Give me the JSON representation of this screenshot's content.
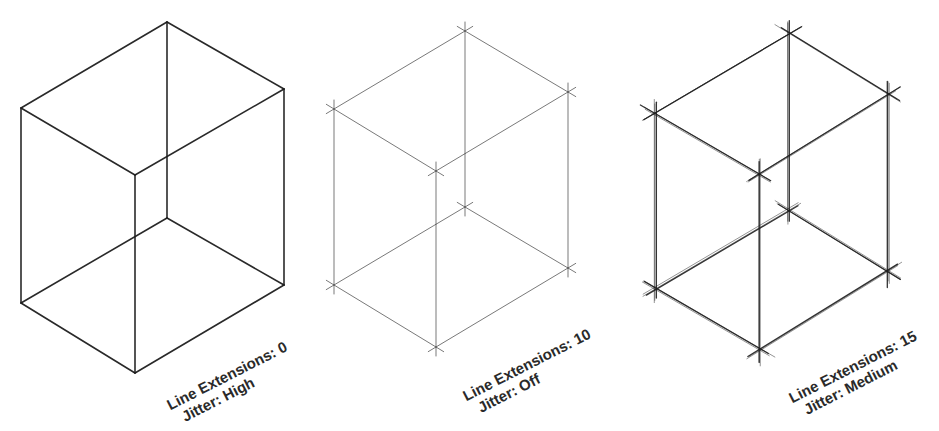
{
  "figure": {
    "background": "#ffffff",
    "line_color": "#1e1e1e",
    "panels": [
      {
        "id": "cube-1",
        "line_extensions_label": "Line Extensions: 0",
        "jitter_label": "Jitter: High",
        "line_extensions": 0,
        "jitter": "High",
        "vertices": {
          "top": [
            167,
            22
          ],
          "upper_left": [
            21,
            108
          ],
          "upper_right": [
            284,
            89
          ],
          "front_top": [
            135,
            175
          ],
          "back_bottom": [
            167,
            218
          ],
          "lower_left": [
            21,
            303
          ],
          "lower_right": [
            284,
            285
          ],
          "front_bottom": [
            135,
            373
          ]
        }
      },
      {
        "id": "cube-2",
        "line_extensions_label": "Line Extensions: 10",
        "jitter_label": "Jitter: Off",
        "line_extensions": 10,
        "jitter": "Off",
        "vertices": {
          "top": [
            465,
            31
          ],
          "upper_left": [
            334,
            109
          ],
          "upper_right": [
            568,
            92
          ],
          "front_top": [
            436,
            171
          ],
          "back_bottom": [
            465,
            207
          ],
          "lower_left": [
            334,
            285
          ],
          "lower_right": [
            568,
            268
          ],
          "front_bottom": [
            436,
            347
          ]
        }
      },
      {
        "id": "cube-3",
        "line_extensions_label": "Line Extensions: 15",
        "jitter_label": "Jitter: Medium",
        "line_extensions": 15,
        "jitter": "Medium",
        "vertices": {
          "top": [
            789,
            34
          ],
          "upper_left": [
            655,
            113
          ],
          "upper_right": [
            888,
            95
          ],
          "front_top": [
            760,
            174
          ],
          "back_bottom": [
            789,
            210
          ],
          "lower_left": [
            655,
            289
          ],
          "lower_right": [
            888,
            271
          ],
          "front_bottom": [
            760,
            350
          ]
        }
      }
    ]
  }
}
